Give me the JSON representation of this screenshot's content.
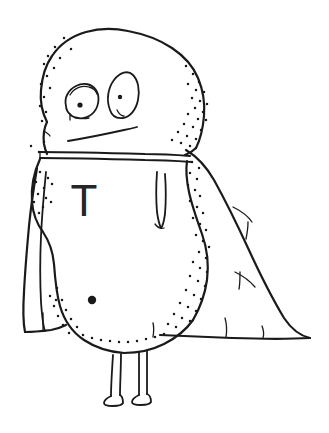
{
  "artwork": {
    "title": "Caped Blob Character",
    "medium": "hand-drawn ink line art",
    "background_color": "#ffffff",
    "ink_color": "#1a1a1a",
    "width": 329,
    "height": 433
  },
  "character": {
    "chest_letter": "T",
    "chest_letter_color": "#262626",
    "parts": {
      "head": "head-blob",
      "left_eye": "left-eye",
      "right_eye": "right-eye",
      "mouth": "mouth-line",
      "collar": "collar-band",
      "body": "body-blob",
      "cape": "cape-drape",
      "navel": "navel-dot",
      "left_leg": "left-leg",
      "right_leg": "right-leg",
      "arm_fold": "arm-fold-crease"
    }
  },
  "stipple": {
    "head_left": [
      [
        64,
        38
      ],
      [
        55,
        47
      ],
      [
        71,
        49
      ],
      [
        48,
        56
      ],
      [
        60,
        58
      ],
      [
        44,
        64
      ],
      [
        54,
        68
      ],
      [
        47,
        76
      ],
      [
        41,
        84
      ],
      [
        50,
        88
      ],
      [
        44,
        97
      ],
      [
        40,
        106
      ],
      [
        46,
        112
      ],
      [
        42,
        121
      ]
    ],
    "head_right": [
      [
        186,
        66
      ],
      [
        193,
        74
      ],
      [
        199,
        82
      ],
      [
        188,
        84
      ],
      [
        196,
        90
      ],
      [
        204,
        92
      ],
      [
        192,
        98
      ],
      [
        200,
        101
      ],
      [
        207,
        104
      ],
      [
        195,
        108
      ],
      [
        203,
        112
      ],
      [
        188,
        114
      ],
      [
        198,
        119
      ],
      [
        206,
        120
      ],
      [
        184,
        124
      ],
      [
        193,
        127
      ],
      [
        201,
        130
      ],
      [
        178,
        132
      ],
      [
        187,
        136
      ],
      [
        196,
        139
      ],
      [
        172,
        140
      ],
      [
        181,
        143
      ],
      [
        190,
        146
      ]
    ],
    "body_left": [
      [
        40,
        172
      ],
      [
        48,
        178
      ],
      [
        36,
        182
      ],
      [
        44,
        188
      ],
      [
        52,
        184
      ],
      [
        38,
        194
      ],
      [
        46,
        198
      ],
      [
        34,
        202
      ],
      [
        43,
        207
      ],
      [
        51,
        202
      ],
      [
        39,
        213
      ]
    ],
    "body_right": [
      [
        192,
        162
      ],
      [
        199,
        168
      ],
      [
        190,
        173
      ],
      [
        197,
        179
      ],
      [
        188,
        185
      ],
      [
        195,
        190
      ],
      [
        200,
        196
      ],
      [
        190,
        201
      ],
      [
        197,
        207
      ],
      [
        203,
        213
      ],
      [
        193,
        218
      ],
      [
        200,
        224
      ],
      [
        206,
        230
      ],
      [
        196,
        235
      ],
      [
        203,
        241
      ],
      [
        209,
        247
      ],
      [
        199,
        252
      ],
      [
        206,
        258
      ],
      [
        193,
        262
      ],
      [
        200,
        268
      ],
      [
        207,
        272
      ],
      [
        190,
        276
      ],
      [
        198,
        281
      ],
      [
        205,
        286
      ],
      [
        186,
        290
      ],
      [
        194,
        295
      ],
      [
        201,
        299
      ],
      [
        180,
        303
      ],
      [
        188,
        307
      ],
      [
        196,
        311
      ],
      [
        174,
        314
      ],
      [
        182,
        318
      ],
      [
        190,
        321
      ],
      [
        168,
        324
      ],
      [
        176,
        327
      ]
    ],
    "belly_lower_left": [
      [
        57,
        288
      ],
      [
        50,
        296
      ],
      [
        62,
        300
      ],
      [
        54,
        306
      ],
      [
        66,
        310
      ],
      [
        58,
        316
      ],
      [
        71,
        319
      ],
      [
        63,
        325
      ],
      [
        77,
        327
      ],
      [
        69,
        333
      ],
      [
        83,
        335
      ],
      [
        92,
        338
      ],
      [
        101,
        340
      ],
      [
        110,
        341
      ],
      [
        119,
        342
      ],
      [
        128,
        342
      ],
      [
        137,
        341
      ],
      [
        146,
        339
      ],
      [
        155,
        337
      ],
      [
        164,
        334
      ]
    ],
    "collar_area": [
      [
        31,
        146
      ],
      [
        39,
        152
      ],
      [
        56,
        300
      ],
      [
        44,
        142
      ]
    ]
  },
  "labels": {
    "navel_label": "navel-dot",
    "letter_label": "chest-letter-T"
  }
}
